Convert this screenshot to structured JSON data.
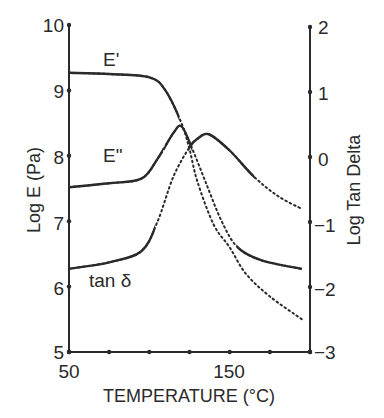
{
  "chart_data": {
    "type": "line",
    "title": "",
    "xlabel": "TEMPERATURE (°C)",
    "ylabel": "Log E (Pa)",
    "y2label": "Log Tan Delta",
    "xlim": [
      50,
      200
    ],
    "ylim": [
      5,
      10
    ],
    "y2lim": [
      -3,
      2
    ],
    "x_tick_labels": [
      "50",
      "150"
    ],
    "x_ticks": [
      50,
      75,
      100,
      125,
      150,
      175,
      200
    ],
    "y_ticks": [
      "5",
      "6",
      "7",
      "8",
      "9",
      "10"
    ],
    "y2_ticks": [
      "−3",
      "−2",
      "−1",
      "0",
      "1",
      "2"
    ],
    "grid": false,
    "legend": "inline labels",
    "series": [
      {
        "name": "E'",
        "axis": "left",
        "x": [
          50,
          75,
          100,
          110,
          120,
          125,
          130,
          140,
          150,
          160,
          175,
          195
        ],
        "values": [
          9.27,
          9.25,
          9.2,
          9.0,
          8.5,
          8.1,
          7.6,
          6.95,
          6.6,
          6.2,
          5.85,
          5.5
        ]
      },
      {
        "name": "E\"",
        "axis": "left",
        "x": [
          50,
          75,
          95,
          105,
          115,
          120,
          126,
          135,
          145,
          155,
          170,
          195
        ],
        "values": [
          7.52,
          7.58,
          7.65,
          7.95,
          8.35,
          8.45,
          8.15,
          7.6,
          7.0,
          6.6,
          6.4,
          6.27
        ]
      },
      {
        "name": "tan δ",
        "axis": "right",
        "x": [
          50,
          75,
          95,
          105,
          115,
          125,
          130,
          137,
          150,
          165,
          180,
          195
        ],
        "values": [
          -1.72,
          -1.62,
          -1.45,
          -1.0,
          -0.3,
          0.15,
          0.28,
          0.35,
          0.1,
          -0.3,
          -0.6,
          -0.8
        ]
      }
    ]
  },
  "labels": {
    "e_prime": "E'",
    "e_double_prime": "E\"",
    "tan_delta": "tan δ",
    "x_axis_title": "TEMPERATURE (°C)",
    "y_axis_title": "Log E (Pa)",
    "y2_axis_title": "Log Tan Delta",
    "x_tick_50": "50",
    "x_tick_150": "150",
    "y_ticks": [
      "10",
      "9",
      "8",
      "7",
      "6",
      "5"
    ],
    "y2_ticks": [
      "2",
      "1",
      "0",
      "−1",
      "−2",
      "−3"
    ]
  },
  "colors": {
    "ink": "#2a2a2a"
  }
}
